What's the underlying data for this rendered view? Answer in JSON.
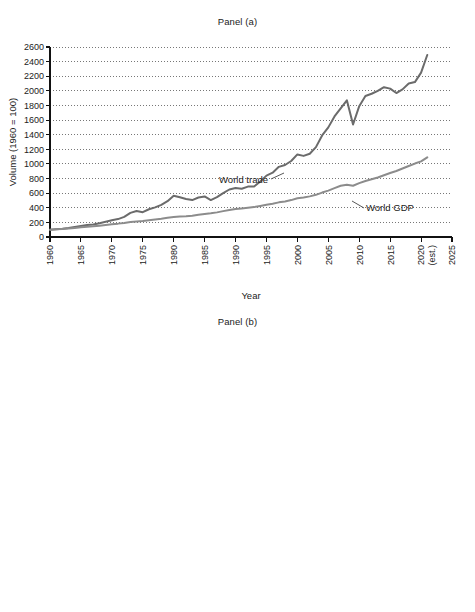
{
  "figure": {
    "background": "#ffffff",
    "xlabel": "Year"
  },
  "panel_a": {
    "title": "Panel (a)",
    "ylabel": "Volume (1960 = 100)",
    "xlabel": "Year",
    "label_world_trade": "World trade",
    "label_world_gdp": "World GDP",
    "color_world_trade": "#6b6b6b",
    "color_world_gdp": "#8c8c8c"
  },
  "panel_b": {
    "title": "Panel (b)",
    "ylabel": "Percent of GDP",
    "xlabel": "Year",
    "label_imports": "U.S. Imports of Goods and Services",
    "label_exports": "U.S. Exports of Goods and Services",
    "color_imports": "#4a4a4a",
    "color_exports": "#a8a8a8"
  },
  "chart_data": [
    {
      "type": "line",
      "title": "Panel (a)",
      "xlabel": "Year",
      "ylabel": "Volume (1960 = 100)",
      "xlim": [
        1960,
        2025
      ],
      "ylim": [
        0,
        2600
      ],
      "yticks": [
        0,
        200,
        400,
        600,
        800,
        1000,
        1200,
        1400,
        1600,
        1800,
        2000,
        2200,
        2400,
        2600
      ],
      "xticks": [
        1960,
        1965,
        1970,
        1975,
        1980,
        1985,
        1990,
        1995,
        2000,
        2005,
        2010,
        2015,
        2020,
        2025
      ],
      "xtick_labels": [
        "1960",
        "1965",
        "1970",
        "1975",
        "1980",
        "1985",
        "1990",
        "1995",
        "2000",
        "2005",
        "2010",
        "2015",
        "2020 (est.)",
        "2025"
      ],
      "grid": "horizontal-dotted",
      "legend": "inline-annotations",
      "x": [
        1960,
        1961,
        1962,
        1963,
        1964,
        1965,
        1966,
        1967,
        1968,
        1969,
        1970,
        1971,
        1972,
        1973,
        1974,
        1975,
        1976,
        1977,
        1978,
        1979,
        1980,
        1981,
        1982,
        1983,
        1984,
        1985,
        1986,
        1987,
        1988,
        1989,
        1990,
        1991,
        1992,
        1993,
        1994,
        1995,
        1996,
        1997,
        1998,
        1999,
        2000,
        2001,
        2002,
        2003,
        2004,
        2005,
        2006,
        2007,
        2008,
        2009,
        2010,
        2011,
        2012,
        2013,
        2014,
        2015,
        2016,
        2017,
        2018,
        2019,
        2020,
        2021
      ],
      "series": [
        {
          "name": "World trade",
          "color": "#6b6b6b",
          "values": [
            100,
            107,
            114,
            123,
            137,
            149,
            163,
            172,
            188,
            209,
            228,
            245,
            275,
            330,
            355,
            340,
            380,
            405,
            440,
            490,
            565,
            545,
            520,
            505,
            540,
            555,
            505,
            545,
            600,
            650,
            670,
            660,
            690,
            690,
            760,
            840,
            880,
            960,
            985,
            1040,
            1130,
            1110,
            1140,
            1230,
            1390,
            1500,
            1650,
            1760,
            1870,
            1540,
            1790,
            1930,
            1960,
            2000,
            2050,
            2030,
            1970,
            2020,
            2100,
            2120,
            2250,
            2490
          ]
        },
        {
          "name": "World GDP",
          "color": "#8c8c8c",
          "values": [
            100,
            105,
            111,
            117,
            124,
            132,
            140,
            146,
            155,
            165,
            175,
            183,
            193,
            206,
            213,
            218,
            229,
            239,
            250,
            263,
            273,
            279,
            283,
            291,
            304,
            315,
            325,
            337,
            354,
            369,
            382,
            390,
            399,
            409,
            425,
            440,
            456,
            474,
            487,
            505,
            531,
            541,
            556,
            577,
            608,
            635,
            668,
            701,
            716,
            701,
            737,
            767,
            790,
            815,
            845,
            875,
            903,
            937,
            972,
            1005,
            1035,
            1090
          ]
        }
      ],
      "annotations": [
        {
          "text": "World trade",
          "x": 1993,
          "y": 830
        },
        {
          "text": "World GDP",
          "x": 2014,
          "y": 520
        }
      ]
    },
    {
      "type": "line",
      "title": "Panel (b)",
      "xlabel": "Year",
      "ylabel": "Percent of GDP",
      "xlim": [
        1950,
        2025
      ],
      "ylim": [
        0,
        20
      ],
      "yticks": [
        0,
        2,
        4,
        6,
        8,
        10,
        12,
        14,
        16,
        18,
        20
      ],
      "xticks": [
        1950,
        1955,
        1960,
        1965,
        1970,
        1975,
        1980,
        1985,
        1990,
        1995,
        2000,
        2005,
        2010,
        2015,
        2020,
        2025
      ],
      "xtick_labels": [
        "1950",
        "1955",
        "1960",
        "1965",
        "1970",
        "1975",
        "1980",
        "1985",
        "1990",
        "1995",
        "2000",
        "2005",
        "2010",
        "2015",
        "2020 (est.)",
        "2025"
      ],
      "grid": "horizontal-dotted",
      "legend": "inline-annotations",
      "x": [
        1950,
        1951,
        1952,
        1953,
        1954,
        1955,
        1956,
        1957,
        1958,
        1959,
        1960,
        1961,
        1962,
        1963,
        1964,
        1965,
        1966,
        1967,
        1968,
        1969,
        1970,
        1971,
        1972,
        1973,
        1974,
        1975,
        1976,
        1977,
        1978,
        1979,
        1980,
        1981,
        1982,
        1983,
        1984,
        1985,
        1986,
        1987,
        1988,
        1989,
        1990,
        1991,
        1992,
        1993,
        1994,
        1995,
        1996,
        1997,
        1998,
        1999,
        2000,
        2001,
        2002,
        2003,
        2004,
        2005,
        2006,
        2007,
        2008,
        2009,
        2010,
        2011,
        2012,
        2013,
        2014,
        2015,
        2016,
        2017,
        2018,
        2019,
        2020,
        2021
      ],
      "series": [
        {
          "name": "U.S. Imports of Goods and Services",
          "color": "#4a4a4a",
          "values": [
            3.8,
            4.4,
            4.3,
            4.2,
            4.0,
            4.2,
            4.4,
            4.4,
            4.2,
            4.4,
            4.2,
            4.1,
            4.3,
            4.3,
            4.2,
            4.4,
            4.8,
            4.8,
            5.2,
            5.2,
            5.4,
            5.5,
            6.0,
            6.6,
            8.3,
            7.4,
            8.3,
            9.0,
            9.3,
            9.9,
            10.2,
            9.6,
            9.2,
            9.3,
            10.0,
            9.9,
            10.1,
            10.5,
            10.5,
            10.5,
            10.8,
            10.4,
            10.4,
            10.8,
            11.5,
            12.0,
            12.1,
            12.5,
            12.3,
            13.0,
            14.4,
            13.0,
            13.1,
            13.4,
            14.4,
            15.3,
            16.2,
            16.4,
            17.4,
            13.8,
            16.4,
            17.3,
            17.1,
            16.6,
            16.4,
            15.1,
            14.6,
            15.0,
            15.4,
            15.4,
            15.7,
            16.2
          ]
        },
        {
          "name": "U.S. Exports of Goods and Services",
          "color": "#a8a8a8",
          "values": [
            5.3,
            4.3,
            4.8,
            4.4,
            4.7,
            4.8,
            5.5,
            5.7,
            4.8,
            4.4,
            5.1,
            5.0,
            4.9,
            5.0,
            5.4,
            5.1,
            5.2,
            5.1,
            5.3,
            5.2,
            5.7,
            5.4,
            5.5,
            6.8,
            8.2,
            8.3,
            8.1,
            7.6,
            8.0,
            9.0,
            10.0,
            9.5,
            8.5,
            7.6,
            7.3,
            7.0,
            7.0,
            7.5,
            8.5,
            9.0,
            9.3,
            9.7,
            9.8,
            9.5,
            9.9,
            10.6,
            10.8,
            11.1,
            10.5,
            10.2,
            10.7,
            9.7,
            9.1,
            9.0,
            9.5,
            10.0,
            10.7,
            11.5,
            12.4,
            10.9,
            12.3,
            13.6,
            13.5,
            13.5,
            13.5,
            12.4,
            11.9,
            12.2,
            12.3,
            12.4,
            12.5,
            13.0
          ]
        }
      ],
      "annotations": [
        {
          "text": "U.S. Imports of Goods and Services",
          "x": 1975,
          "y": 13.0
        },
        {
          "text": "U.S. Exports of Goods and Services",
          "x": 1993,
          "y": 7.0
        }
      ]
    }
  ]
}
